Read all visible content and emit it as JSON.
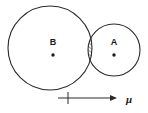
{
  "figure": {
    "background_color": "#ffffff",
    "stroke_color": "#2a2a2a",
    "text_color": "#1a1a1a",
    "hatch_color": "#2a2a2a"
  },
  "circles": [
    {
      "id": "circle-b",
      "label": "B",
      "label_x": 53,
      "label_y": 45,
      "center_x": 50,
      "center_y": 48,
      "radius": 42,
      "center_dot_x": 53,
      "center_dot_y": 55,
      "center_dot_radius": 1.7,
      "filled": false
    },
    {
      "id": "circle-a",
      "label": "A",
      "label_x": 114,
      "label_y": 45,
      "center_x": 114,
      "center_y": 50,
      "radius": 26,
      "center_dot_x": 114,
      "center_dot_y": 55,
      "center_dot_radius": 1.7,
      "filled": false
    }
  ],
  "intersection": {
    "id": "lens-region",
    "description": "hatched lens where circle A and circle B overlap",
    "hatch_direction": "lower-left-to-upper-right",
    "hatch_spacing": 3,
    "x_left": 88.3,
    "x_right": 91.8,
    "y_top": 27.5,
    "y_bottom": 72.5
  },
  "axis": {
    "id": "mu-axis",
    "label": "μ",
    "label_x": 126,
    "label_y": 103,
    "line_start_x": 58,
    "line_end_x": 113,
    "line_y": 98,
    "tick_x": 68,
    "tick_top_y": 92,
    "tick_bottom_y": 104,
    "arrowhead_tip_x": 117,
    "arrowhead_size": 4
  }
}
